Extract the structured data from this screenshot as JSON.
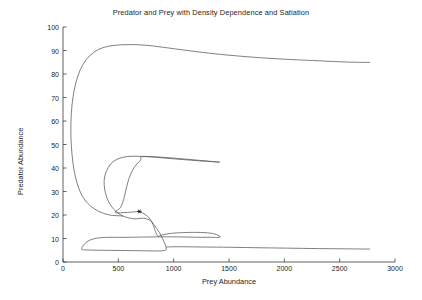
{
  "chart_data": {
    "type": "line",
    "title": "Predator and Prey with Density Dependence and Satiation",
    "xlabel": "Prey Abundance",
    "ylabel": "Predator Abundance",
    "xlim": [
      0,
      3000
    ],
    "ylim": [
      0,
      100
    ],
    "xticks": [
      0,
      500,
      1000,
      1500,
      2000,
      2500,
      3000
    ],
    "yticks": [
      0,
      10,
      20,
      30,
      40,
      50,
      60,
      70,
      80,
      90,
      100
    ],
    "grid": false,
    "legend": "none",
    "line_color": "#555555",
    "background": "#ffffff",
    "axis_color": "#3a3a3a",
    "annotations": [
      {
        "name": "initial-condition-marker",
        "marker": "star",
        "x": 690,
        "y": 21.5
      }
    ],
    "series": [
      {
        "name": "Phase trajectory (outward spiral)",
        "points": [
          [
            690,
            21.5
          ],
          [
            760,
            19.6
          ],
          [
            820,
            16.0
          ],
          [
            870,
            12.6
          ],
          [
            905,
            9.4
          ],
          [
            925,
            7.2
          ],
          [
            932,
            6.0
          ],
          [
            930,
            5.2
          ],
          [
            905,
            4.8
          ],
          [
            840,
            4.7
          ],
          [
            700,
            4.8
          ],
          [
            520,
            4.9
          ],
          [
            330,
            5.0
          ],
          [
            225,
            5.1
          ],
          [
            178,
            5.2
          ],
          [
            168,
            5.6
          ],
          [
            176,
            6.6
          ],
          [
            205,
            8.2
          ],
          [
            248,
            9.4
          ],
          [
            300,
            10.1
          ],
          [
            360,
            10.4
          ],
          [
            430,
            10.5
          ],
          [
            560,
            10.5
          ],
          [
            720,
            10.6
          ],
          [
            880,
            10.7
          ],
          [
            1010,
            10.7
          ],
          [
            1140,
            10.6
          ],
          [
            1250,
            10.5
          ],
          [
            1340,
            10.5
          ],
          [
            1390,
            10.4
          ],
          [
            1420,
            10.6
          ],
          [
            1400,
            11.4
          ],
          [
            1330,
            12.3
          ],
          [
            1210,
            12.6
          ],
          [
            1080,
            12.5
          ],
          [
            980,
            12.2
          ],
          [
            905,
            11.6
          ],
          [
            860,
            11.0
          ],
          [
            835,
            13.0
          ],
          [
            818,
            15.4
          ],
          [
            790,
            17.6
          ],
          [
            730,
            18.6
          ],
          [
            640,
            18.4
          ],
          [
            540,
            19.6
          ],
          [
            460,
            22.4
          ],
          [
            405,
            26.4
          ],
          [
            378,
            30.6
          ],
          [
            372,
            34.8
          ],
          [
            392,
            38.6
          ],
          [
            432,
            41.8
          ],
          [
            492,
            43.8
          ],
          [
            570,
            44.8
          ],
          [
            660,
            45.0
          ],
          [
            770,
            44.8
          ],
          [
            900,
            44.3
          ],
          [
            1030,
            43.8
          ],
          [
            1160,
            43.3
          ],
          [
            1280,
            42.9
          ],
          [
            1390,
            42.6
          ],
          [
            770,
            44.9
          ],
          [
            700,
            43.2
          ],
          [
            640,
            40.0
          ],
          [
            600,
            36.0
          ],
          [
            572,
            31.4
          ],
          [
            548,
            26.6
          ],
          [
            520,
            23.2
          ],
          [
            480,
            21.0
          ],
          [
            690,
            21.5
          ]
        ]
      },
      {
        "name": "Phase trajectory (outer loop)",
        "points": [
          [
            540,
            19.6
          ],
          [
            420,
            20.0
          ],
          [
            320,
            21.6
          ],
          [
            240,
            24.2
          ],
          [
            178,
            27.8
          ],
          [
            132,
            32.8
          ],
          [
            100,
            39.0
          ],
          [
            81,
            46.0
          ],
          [
            72,
            53.0
          ],
          [
            72,
            60.0
          ],
          [
            82,
            67.0
          ],
          [
            103,
            73.6
          ],
          [
            136,
            79.4
          ],
          [
            182,
            84.2
          ],
          [
            242,
            87.8
          ],
          [
            318,
            90.4
          ],
          [
            410,
            91.8
          ],
          [
            520,
            92.4
          ],
          [
            640,
            92.5
          ],
          [
            760,
            92.2
          ],
          [
            900,
            91.4
          ],
          [
            1060,
            90.4
          ],
          [
            1260,
            89.2
          ],
          [
            1500,
            88.0
          ],
          [
            1760,
            87.0
          ],
          [
            2040,
            86.2
          ],
          [
            2320,
            85.6
          ],
          [
            2560,
            85.1
          ],
          [
            2770,
            84.9
          ]
        ]
      },
      {
        "name": "Phase trajectory (lower outer arm)",
        "points": [
          [
            935,
            6.4
          ],
          [
            1050,
            6.5
          ],
          [
            1220,
            6.4
          ],
          [
            1450,
            6.3
          ],
          [
            1720,
            6.1
          ],
          [
            2020,
            5.9
          ],
          [
            2320,
            5.7
          ],
          [
            2560,
            5.6
          ],
          [
            2770,
            5.5
          ]
        ]
      }
    ]
  }
}
